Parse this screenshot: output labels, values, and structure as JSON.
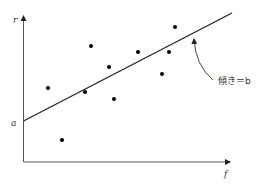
{
  "chart_data": {
    "type": "scatter",
    "title": "",
    "xlabel": "f",
    "ylabel": "r",
    "grid": false,
    "legend": null,
    "intercept_label": "a",
    "annotation": "傾き＝b",
    "pixel_frame": {
      "origin": [
        23.5,
        162
      ],
      "x_axis_end": [
        230,
        162
      ],
      "y_axis_end": [
        23.5,
        16
      ]
    },
    "points_px": [
      [
        48,
        88
      ],
      [
        62,
        140
      ],
      [
        85,
        92
      ],
      [
        91,
        46
      ],
      [
        109,
        67
      ],
      [
        114,
        99
      ],
      [
        138,
        52
      ],
      [
        162,
        74
      ],
      [
        169,
        52
      ],
      [
        175,
        27
      ]
    ],
    "regression_line_px": {
      "start": [
        23.5,
        121
      ],
      "end": [
        232,
        13
      ]
    },
    "annotation_arrow_px": {
      "tail": [
        213,
        80
      ],
      "head": [
        194,
        39
      ]
    },
    "annotation_pos_px": [
      218,
      84
    ],
    "colors": {
      "axis": "#555555",
      "line": "#222222",
      "point": "#000000",
      "text": "#333333"
    }
  }
}
